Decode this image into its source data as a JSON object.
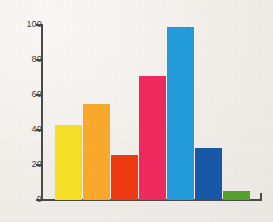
{
  "chart_data": {
    "type": "bar",
    "title": "",
    "subtitle": "",
    "xlabel": "",
    "ylabel": "",
    "categories": [
      "1",
      "2",
      "3",
      "4",
      "5",
      "6",
      "7"
    ],
    "values": [
      43,
      55,
      26,
      71,
      99,
      30,
      5
    ],
    "colors": [
      "#f5df26",
      "#f9a92c",
      "#ef3b12",
      "#ee2a5e",
      "#249bdb",
      "#1759a8",
      "#54a32c"
    ],
    "series": [
      {
        "name": "series-1",
        "values": [
          43,
          55,
          26,
          71,
          99,
          30,
          5
        ]
      }
    ],
    "ylim": [
      0,
      100
    ],
    "xlim": [
      0,
      7
    ],
    "yticks": [
      0,
      20,
      40,
      60,
      80,
      100
    ],
    "ytick_labels": [
      "0",
      "20",
      "40",
      "60",
      "80",
      "100"
    ],
    "xtick_labels": [],
    "grid": false,
    "legend": false,
    "legend_position": "none",
    "annotations": []
  },
  "style": {
    "background_color": "#f1eeea",
    "axis_color": "#4a4a4a",
    "tick_label_color": "#3e3e3e"
  }
}
